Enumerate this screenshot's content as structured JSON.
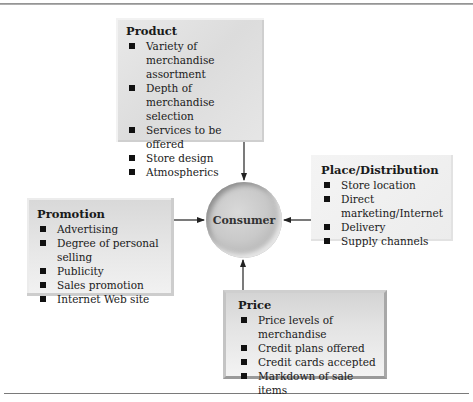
{
  "diagram": {
    "center": {
      "label": "Consumer"
    },
    "product": {
      "title": "Product",
      "items": [
        "Variety of merchandise assortment",
        "Depth of merchandise selection",
        "Services to be offered",
        "Store design",
        "Atmospherics"
      ]
    },
    "place": {
      "title": "Place/Distribution",
      "items": [
        "Store location",
        "Direct marketing/Internet",
        "Delivery",
        "Supply channels"
      ]
    },
    "promotion": {
      "title": "Promotion",
      "items": [
        "Advertising",
        "Degree of personal selling",
        "Publicity",
        "Sales promotion",
        "Internet Web site"
      ]
    },
    "price": {
      "title": "Price",
      "items": [
        "Price levels of merchandise",
        "Credit plans offered",
        "Credit cards accepted",
        "Markdown of sale items"
      ]
    },
    "colors": {
      "arrow": "#222222",
      "box_fill": "#e3e3e3",
      "circle": "#c4c4c4"
    }
  }
}
